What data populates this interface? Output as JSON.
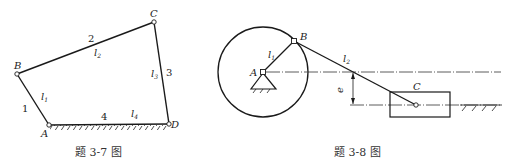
{
  "figure_3_7": {
    "caption": "题 3-7 图",
    "joints": {
      "A": "A",
      "B": "B",
      "C": "C",
      "D": "D"
    },
    "link_numbers": {
      "link1": "1",
      "link2": "2",
      "link3": "3",
      "link4": "4"
    },
    "length_labels": {
      "l1": "l",
      "l1_sub": "1",
      "l2": "l",
      "l2_sub": "2",
      "l3": "l",
      "l3_sub": "3",
      "l4": "l",
      "l4_sub": "4"
    }
  },
  "figure_3_8": {
    "caption": "题 3-8 图",
    "joints": {
      "A": "A",
      "B": "B",
      "C": "C"
    },
    "length_labels": {
      "l1": "l",
      "l1_sub": "1",
      "l2": "l",
      "l2_sub": "2"
    },
    "offset_label": "e"
  },
  "colors": {
    "line": "#1a1a1a",
    "text": "#222222",
    "background": "#ffffff"
  }
}
